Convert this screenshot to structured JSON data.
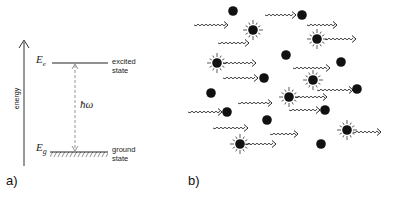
{
  "panel_a": {
    "label": "a)",
    "axis_label": "energy",
    "excited": {
      "symbol": "E",
      "subscript": "e",
      "label_line1": "excited",
      "label_line2": "state"
    },
    "ground": {
      "symbol": "E",
      "subscript": "g",
      "label_line1": "ground",
      "label_line2": "state"
    },
    "transition_label": "ħω"
  },
  "panel_b": {
    "label": "b)",
    "description": "incoming photons (wavy arrows) interacting with atoms; plain dots are ground-state atoms, starbursts are excited atoms",
    "ground_atoms": [
      [
        233,
        11
      ],
      [
        302,
        15
      ],
      [
        286,
        55
      ],
      [
        341,
        62
      ],
      [
        264,
        78
      ],
      [
        211,
        93
      ],
      [
        357,
        89
      ],
      [
        227,
        112
      ],
      [
        325,
        110
      ],
      [
        267,
        120
      ],
      [
        321,
        144
      ]
    ],
    "excited_atoms": [
      [
        253,
        30
      ],
      [
        317,
        39
      ],
      [
        217,
        63
      ],
      [
        313,
        80
      ],
      [
        289,
        97
      ],
      [
        347,
        130
      ],
      [
        240,
        144
      ]
    ],
    "photons": [
      [
        194,
        228,
        25
      ],
      [
        265,
        296,
        15
      ],
      [
        307,
        337,
        25
      ],
      [
        218,
        249,
        43
      ],
      [
        325,
        356,
        39
      ],
      [
        223,
        256,
        63
      ],
      [
        293,
        330,
        68
      ],
      [
        223,
        258,
        78
      ],
      [
        317,
        353,
        90
      ],
      [
        295,
        327,
        97
      ],
      [
        289,
        320,
        110
      ],
      [
        238,
        272,
        103
      ],
      [
        188,
        222,
        112
      ],
      [
        213,
        248,
        128
      ],
      [
        270,
        298,
        134
      ],
      [
        245,
        276,
        144
      ],
      [
        353,
        381,
        132
      ]
    ]
  },
  "colors": {
    "ink": "#111111",
    "dashed": "#888888",
    "background": "#ffffff"
  }
}
